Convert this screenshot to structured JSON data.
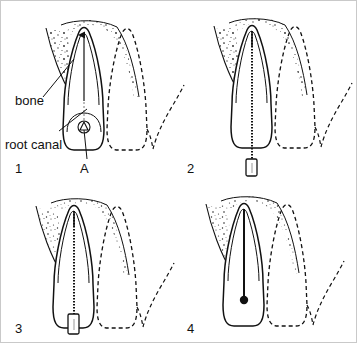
{
  "figure": {
    "border_color": "#c9c9c9",
    "background": "#ffffff",
    "ink_color": "#111111"
  },
  "labels": {
    "bone": "bone",
    "root_canal": "root canal",
    "point_a": "A"
  },
  "panels": [
    {
      "number": "1",
      "caption_number": "1",
      "description": "Tooth with root canal indicated, access point A at crown, surrounding bone stippled, adjacent tooth dashed"
    },
    {
      "number": "2",
      "caption_number": "2",
      "description": "Endodontic file inserted full length through canal with rubber stop hanging below crown"
    },
    {
      "number": "3",
      "caption_number": "3",
      "description": "File seated to working length with rubber stop resting at the crown access opening"
    },
    {
      "number": "4",
      "caption_number": "4",
      "description": "Canal obturated, filled canal shown as solid line ending in rounded mass at access"
    }
  ],
  "legend": {
    "solid_outline": "treated tooth",
    "dashed_outline": "adjacent tooth",
    "stipple": "bone"
  }
}
